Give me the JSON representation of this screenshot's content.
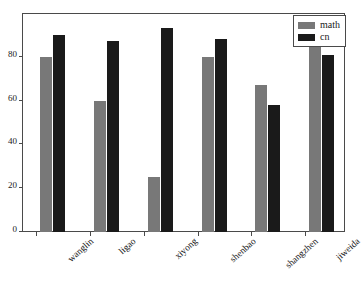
{
  "chart_data": {
    "type": "bar",
    "title": "",
    "xlabel": "",
    "ylabel": "",
    "categories": [
      "wanglin",
      "ligao",
      "xiyong",
      "shenbao",
      "shangzhen",
      "jiweida"
    ],
    "series": [
      {
        "name": "math",
        "color": "#787878",
        "values": [
          80,
          60,
          25,
          80,
          67,
          85
        ]
      },
      {
        "name": "cn",
        "color": "#1a1a1a",
        "values": [
          90,
          87,
          93,
          88,
          58,
          81
        ]
      }
    ],
    "yticks": [
      0,
      20,
      40,
      60,
      80
    ],
    "ylim": [
      0,
      100
    ],
    "grid": false,
    "legend_position": "top-right",
    "legend_entries": [
      "math",
      "cn"
    ]
  }
}
